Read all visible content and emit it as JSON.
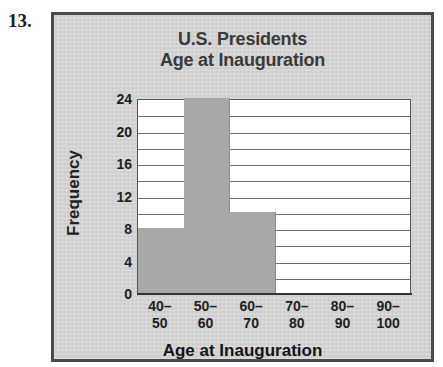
{
  "problem": {
    "number": "13."
  },
  "panel": {
    "background_color": "#d3d3d3",
    "border_color": "#4a4a4a"
  },
  "chart_data": {
    "type": "bar",
    "title_line1": "U.S. Presidents",
    "title_line2": "Age at Inauguration",
    "title": "U.S. Presidents Age at Inauguration",
    "xlabel": "Age at Inauguration",
    "ylabel": "Frequency",
    "categories": [
      "40–50",
      "50–60",
      "60–70",
      "70–80",
      "80–90",
      "90–100"
    ],
    "category_lines": [
      [
        "40–",
        "50"
      ],
      [
        "50–",
        "60"
      ],
      [
        "60–",
        "70"
      ],
      [
        "70–",
        "80"
      ],
      [
        "80–",
        "90"
      ],
      [
        "90–",
        "100"
      ]
    ],
    "values": [
      8,
      24,
      10,
      0,
      0,
      0
    ],
    "ylim": [
      0,
      24
    ],
    "ytick_labels": [
      "0",
      "4",
      "8",
      "12",
      "16",
      "20",
      "24"
    ],
    "ytick_values": [
      0,
      4,
      8,
      12,
      16,
      20,
      24
    ],
    "gridline_values": [
      2,
      4,
      6,
      8,
      10,
      12,
      14,
      16,
      18,
      20,
      22
    ],
    "grid": true,
    "legend": "none",
    "bar_color": "#a8a8a8",
    "plot_background": "#ffffff",
    "axis_color": "#585858",
    "title_color": "#3a3a3a"
  }
}
